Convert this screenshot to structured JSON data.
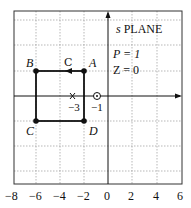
{
  "title": "s PLANE",
  "title_s": "s",
  "title_rest": " PLANE",
  "annotations": {
    "poles_label": "P = 1",
    "zeros_label": "Z = 0",
    "contour_label": "C"
  },
  "points": [
    {
      "name": "A",
      "x": -2,
      "y": 1
    },
    {
      "name": "B",
      "x": -6,
      "y": 1
    },
    {
      "name": "C",
      "x": -6,
      "y": -1
    },
    {
      "name": "D",
      "x": -2,
      "y": -1
    }
  ],
  "pole": {
    "x": -3,
    "label": "−3"
  },
  "zero_marker": {
    "x": -1,
    "label": "−1"
  },
  "x_ticks": [
    "−8",
    "−6",
    "−4",
    "−2",
    "0",
    "2",
    "4",
    "6"
  ],
  "colors": {
    "line": "#111111",
    "grid": "#888888"
  }
}
